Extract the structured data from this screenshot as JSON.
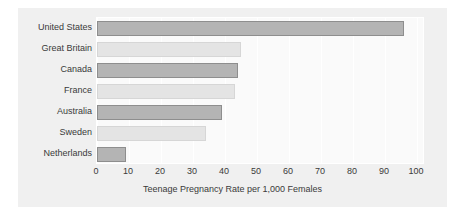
{
  "chart_data": {
    "type": "bar",
    "orientation": "horizontal",
    "title": "",
    "xlabel": "Teenage Pregnancy Rate per 1,000 Females",
    "ylabel": "",
    "xlim": [
      0,
      100
    ],
    "xticks": [
      0,
      10,
      20,
      30,
      40,
      50,
      60,
      70,
      80,
      90,
      100
    ],
    "xtick_labels": [
      "0",
      "10",
      "20",
      "30",
      "40",
      "50",
      "60",
      "70",
      "80",
      "90",
      "100"
    ],
    "grid": "vertical",
    "legend": "none",
    "categories": [
      "United States",
      "Great Britain",
      "Canada",
      "France",
      "Australia",
      "Sweden",
      "Netherlands"
    ],
    "values": [
      96,
      45,
      44,
      43,
      39,
      34,
      9
    ],
    "bar_styles": [
      "dark",
      "light",
      "dark",
      "light",
      "dark",
      "light",
      "dark"
    ],
    "colors": {
      "figure_background": "#ffffff",
      "panel_background": "#f0f0f0",
      "plot_background": "#fafafa",
      "gridline": "#ffffff",
      "bar_dark_fill": "#b4b4b4",
      "bar_dark_edge": "#8e8e8e",
      "bar_light_fill": "#e4e4e4",
      "bar_light_edge": "#d6d6d6",
      "text": "#3a3a3a"
    }
  }
}
